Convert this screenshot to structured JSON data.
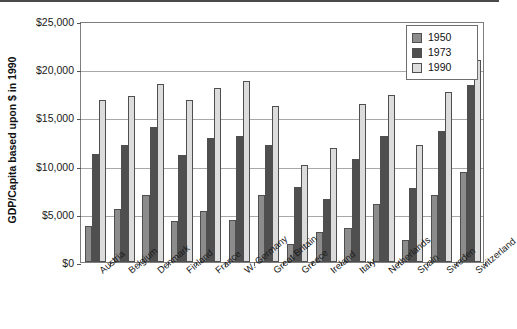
{
  "chart_data": {
    "type": "bar",
    "title": "",
    "xlabel": "",
    "ylabel": "GDP/Capita based upon $ in 1990",
    "ylim": [
      0,
      25000
    ],
    "ytick_values": [
      0,
      5000,
      10000,
      15000,
      20000,
      25000
    ],
    "ytick_labels": [
      "$0",
      "$5,000",
      "$10,000",
      "$15,000",
      "$20,000",
      "$25,000"
    ],
    "grid": true,
    "legend_position": "top-right",
    "categories": [
      "Austria",
      "Belgium",
      "Denmark",
      "Finland",
      "France",
      "W. Germany",
      "Great Britain",
      "Greece",
      "Ireland",
      "Italy",
      "Netherlands",
      "Spain",
      "Sweden",
      "Switzerland"
    ],
    "series": [
      {
        "name": "1950",
        "color": "#8c8c8c",
        "values": [
          3700,
          5500,
          7000,
          4300,
          5300,
          4400,
          7000,
          1900,
          3100,
          3500,
          6000,
          2300,
          6900,
          9300
        ]
      },
      {
        "name": "1973",
        "color": "#4f4f4f",
        "values": [
          11200,
          12100,
          14000,
          11100,
          12900,
          13100,
          12100,
          7800,
          6500,
          10700,
          13100,
          7700,
          13600,
          18400
        ]
      },
      {
        "name": "1990",
        "color": "#dcdcdc",
        "values": [
          16800,
          17200,
          18500,
          16800,
          18100,
          18800,
          16200,
          10100,
          11800,
          16400,
          17300,
          12100,
          17600,
          21000
        ]
      }
    ]
  },
  "legend": {
    "items": [
      {
        "label": "1950",
        "color": "#8c8c8c"
      },
      {
        "label": "1973",
        "color": "#4f4f4f"
      },
      {
        "label": "1990",
        "color": "#dcdcdc"
      }
    ]
  },
  "axis": {
    "y_title": "GDP/Capita based upon $ in 1990"
  }
}
